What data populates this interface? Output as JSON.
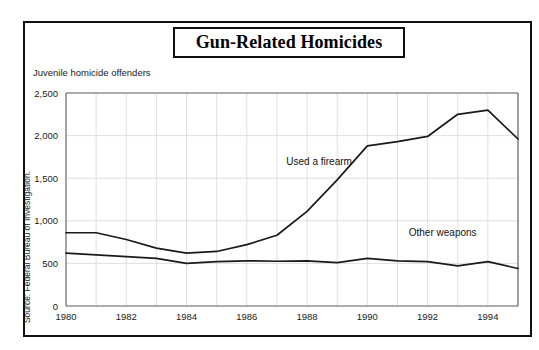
{
  "figure": {
    "title": "Gun-Related Homicides",
    "subtitle": "Juvenile homicide offenders",
    "source_note": "Source: Federal Bureau of Investigation."
  },
  "chart_data": {
    "type": "line",
    "title": "Gun-Related Homicides",
    "subtitle": "Juvenile homicide offenders",
    "xlabel": "",
    "ylabel": "Juvenile homicide offenders",
    "xlim": [
      1980,
      1995
    ],
    "ylim": [
      0,
      2500
    ],
    "ytick_values": [
      0,
      500,
      1000,
      1500,
      2000,
      2500
    ],
    "ytick_labels": [
      "0",
      "500",
      "1,000",
      "1,500",
      "2,000",
      "2,500"
    ],
    "xtick_values": [
      1980,
      1982,
      1984,
      1986,
      1988,
      1990,
      1992,
      1994
    ],
    "xtick_labels": [
      "1980",
      "1982",
      "1984",
      "1986",
      "1988",
      "1990",
      "1992",
      "1994"
    ],
    "grid": "both",
    "legend_position": "inline-annotation",
    "x": [
      1980,
      1981,
      1982,
      1983,
      1984,
      1985,
      1986,
      1987,
      1988,
      1989,
      1990,
      1991,
      1992,
      1993,
      1994,
      1995
    ],
    "series": [
      {
        "name": "Used a firearm",
        "annotation": "Used a firearm",
        "color": "#1a1a1a",
        "values": [
          860,
          860,
          780,
          680,
          620,
          640,
          720,
          830,
          1110,
          1480,
          1880,
          1930,
          1990,
          2250,
          2300,
          1960
        ]
      },
      {
        "name": "Other weapons",
        "annotation": "Other weapons",
        "color": "#1a1a1a",
        "values": [
          620,
          600,
          580,
          560,
          500,
          520,
          530,
          525,
          530,
          510,
          560,
          530,
          520,
          470,
          520,
          440
        ]
      }
    ],
    "annotations": [
      {
        "text": "Used a firearm",
        "x": 1988.4,
        "y": 1660
      },
      {
        "text": "Other weapons",
        "x": 1992.5,
        "y": 820
      }
    ]
  }
}
